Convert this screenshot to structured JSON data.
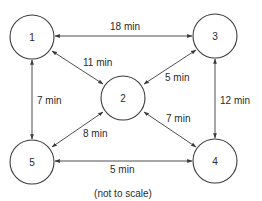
{
  "diagram": {
    "type": "network-graph",
    "nodes": [
      {
        "id": "1",
        "label": "1",
        "cx": 32,
        "cy": 37
      },
      {
        "id": "2",
        "label": "2",
        "cx": 123,
        "cy": 98
      },
      {
        "id": "3",
        "label": "3",
        "cx": 215,
        "cy": 36
      },
      {
        "id": "4",
        "label": "4",
        "cx": 215,
        "cy": 161
      },
      {
        "id": "5",
        "label": "5",
        "cx": 32,
        "cy": 162
      }
    ],
    "edges": [
      {
        "from": "1",
        "to": "3",
        "label": "18 min",
        "bidirectional": true
      },
      {
        "from": "1",
        "to": "2",
        "label": "11 min",
        "bidirectional": true
      },
      {
        "from": "2",
        "to": "3",
        "label": "5 min",
        "bidirectional": true
      },
      {
        "from": "1",
        "to": "5",
        "label": "7 min",
        "bidirectional": true
      },
      {
        "from": "3",
        "to": "4",
        "label": "12 min",
        "bidirectional": true
      },
      {
        "from": "2",
        "to": "5",
        "label": "8 min",
        "bidirectional": true
      },
      {
        "from": "2",
        "to": "4",
        "label": "7 min",
        "bidirectional": true
      },
      {
        "from": "5",
        "to": "4",
        "label": "5 min",
        "bidirectional": true
      }
    ],
    "note": "(not to scale)"
  }
}
